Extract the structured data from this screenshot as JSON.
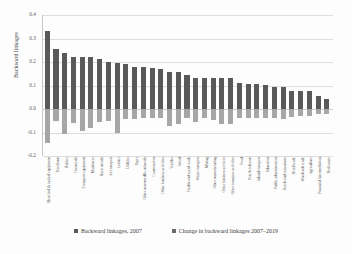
{
  "chart_data": {
    "type": "bar",
    "title": "",
    "xlabel": "",
    "ylabel": "Backward linkages",
    "ylim": [
      -0.2,
      0.4
    ],
    "yticks": [
      "0.4",
      "0.3",
      "0.2",
      "0.1",
      "0.0",
      "-0.1",
      "-0.2"
    ],
    "grid": true,
    "legend_position": "bottom",
    "stacked": false,
    "categories": [
      "Electrical & optical equipment",
      "Petroleum",
      "Rubber",
      "Chemicals",
      "Transport equipment",
      "Machinery",
      "Basic metals",
      "Air transport",
      "Leather",
      "Utilities",
      "Paper",
      "Other non-metallic minerals",
      "Construction",
      "Other business activities",
      "Textiles",
      "Wood",
      "Health and social work",
      "Water transport",
      "Mining",
      "Other manufacturing",
      "Other business services",
      "Other transport activities",
      "Food",
      "Post & telecom",
      "Inland transport",
      "Education",
      "Public administration",
      "Hotels and restaurants",
      "Retail trade",
      "Wholesale trade",
      "Agriculture",
      "Financial intermediation",
      "Real estate"
    ],
    "series": [
      {
        "name": "Backward linkages, 2007",
        "color": "#59595b",
        "values": [
          0.332,
          0.256,
          0.24,
          0.222,
          0.221,
          0.22,
          0.212,
          0.198,
          0.195,
          0.192,
          0.18,
          0.177,
          0.175,
          0.172,
          0.157,
          0.156,
          0.146,
          0.134,
          0.134,
          0.134,
          0.134,
          0.13,
          0.111,
          0.107,
          0.107,
          0.102,
          0.095,
          0.093,
          0.078,
          0.077,
          0.077,
          0.055,
          0.041
        ]
      },
      {
        "name": "Change in backward linkages 2007–2019",
        "color": "#a6a6a8",
        "values": [
          -0.145,
          -0.05,
          -0.105,
          -0.06,
          -0.095,
          -0.08,
          -0.055,
          -0.052,
          -0.1,
          -0.043,
          -0.042,
          -0.04,
          -0.04,
          -0.04,
          -0.073,
          -0.063,
          -0.04,
          -0.055,
          -0.04,
          -0.048,
          -0.062,
          -0.063,
          -0.038,
          -0.038,
          -0.04,
          -0.04,
          -0.04,
          -0.042,
          -0.032,
          -0.03,
          -0.03,
          -0.02,
          -0.022
        ]
      }
    ],
    "legend": [
      "Backward linkages, 2007",
      "Change in backward linkages 2007–2019"
    ]
  }
}
